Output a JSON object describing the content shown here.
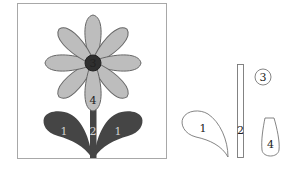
{
  "diagram": {
    "title": "",
    "colors": {
      "frame": "#a8a8a8",
      "petal_fill": "#bdbdbd",
      "petal_stroke": "#666666",
      "center_fill": "#2f2f2f",
      "leaf_fill": "#454545",
      "stem_fill": "#454545",
      "outline": "#777777",
      "background": "#ffffff"
    },
    "assembled_flower": {
      "center_label": "3",
      "petal_label": "4",
      "stem_label": "2",
      "left_leaf_label": "1",
      "right_leaf_label": "1",
      "petal_count": 8
    },
    "parts": {
      "leaf_label": "1",
      "stem_label": "2",
      "center_label": "3",
      "petal_label": "4"
    }
  }
}
